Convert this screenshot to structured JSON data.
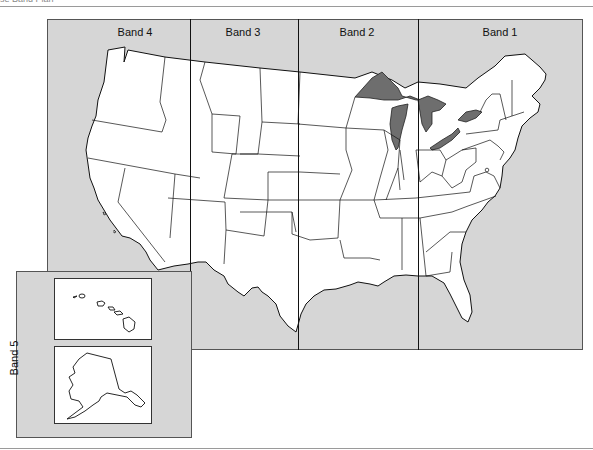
{
  "page": {
    "caption": "se Band Plan"
  },
  "map": {
    "background_color": "#d6d6d6",
    "land_color": "#ffffff",
    "water_color": "#6e6e6e",
    "outline_color": "#111111",
    "bands": [
      {
        "id": 4,
        "label": "Band 4",
        "x_start": 47,
        "x_end": 190
      },
      {
        "id": 3,
        "label": "Band 3",
        "x_start": 190,
        "x_end": 298
      },
      {
        "id": 2,
        "label": "Band 2",
        "x_start": 298,
        "x_end": 418
      },
      {
        "id": 1,
        "label": "Band 1",
        "x_start": 418,
        "x_end": 583
      }
    ],
    "inset": {
      "label": "Band 5",
      "panels": [
        {
          "name": "Hawaii"
        },
        {
          "name": "Alaska"
        }
      ]
    }
  }
}
